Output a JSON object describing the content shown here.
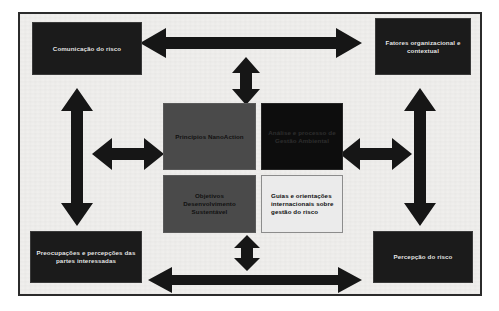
{
  "figure": {
    "background_color": "#f1f0ee",
    "frame_color": "#2b2b2b",
    "arrow_color": "#161616"
  },
  "nodes": {
    "comunicacao_risco": {
      "label": "Comunicação do risco",
      "style": "dark",
      "fill": "#1b1b1b",
      "text_color": "#e8e8e8"
    },
    "fatores_organizacional": {
      "label": "Fatores organizacional e contextual",
      "style": "dark",
      "fill": "#1b1b1b",
      "text_color": "#e8e8e8"
    },
    "preocupacoes_partes": {
      "label": "Preocupações e percepções das partes interessadas",
      "style": "dark",
      "fill": "#1b1b1b",
      "text_color": "#e8e8e8"
    },
    "percepcao_risco": {
      "label": "Percepção do risco",
      "style": "dark",
      "fill": "#1b1b1b",
      "text_color": "#e8e8e8"
    },
    "principios_nanoaction": {
      "label": "Princípios NanoAction",
      "style": "mid",
      "fill": "#4a4a4a",
      "text_color": "#111111"
    },
    "analise_processo": {
      "label": "Análise e processo de Gestão Ambiental",
      "style": "darkest",
      "fill": "#0d0d0d",
      "text_color": "#2e2e2e"
    },
    "objetivos_desenvolvimento": {
      "label": "Objetivos Desenvolvimento Sustentável",
      "style": "mid",
      "fill": "#4a4a4a",
      "text_color": "#111111"
    },
    "guias_orientacoes": {
      "label": "Guias e orientações internacionais sobre gestão do risco",
      "style": "light",
      "fill": "#ebebeb",
      "text_color": "#101010"
    }
  },
  "arrows": [
    {
      "name": "top-horizontal",
      "direction": "bidirectional-horizontal",
      "connects": [
        "comunicacao_risco",
        "fatores_organizacional"
      ]
    },
    {
      "name": "bottom-horizontal",
      "direction": "bidirectional-horizontal",
      "connects": [
        "preocupacoes_partes",
        "percepcao_risco"
      ]
    },
    {
      "name": "top-center-vertical",
      "direction": "bidirectional-vertical",
      "connects": [
        "top-horizontal",
        "principios_nanoaction"
      ]
    },
    {
      "name": "bottom-center-vertical",
      "direction": "bidirectional-vertical",
      "connects": [
        "objetivos_desenvolvimento",
        "bottom-horizontal"
      ]
    },
    {
      "name": "left-vertical",
      "direction": "bidirectional-vertical",
      "connects": [
        "comunicacao_risco",
        "preocupacoes_partes"
      ]
    },
    {
      "name": "right-vertical",
      "direction": "bidirectional-vertical",
      "connects": [
        "fatores_organizacional",
        "percepcao_risco"
      ]
    },
    {
      "name": "left-horizontal",
      "direction": "bidirectional-horizontal",
      "connects": [
        "left-vertical",
        "principios_nanoaction"
      ]
    },
    {
      "name": "right-horizontal",
      "direction": "bidirectional-horizontal",
      "connects": [
        "analise_processo",
        "right-vertical"
      ]
    }
  ]
}
